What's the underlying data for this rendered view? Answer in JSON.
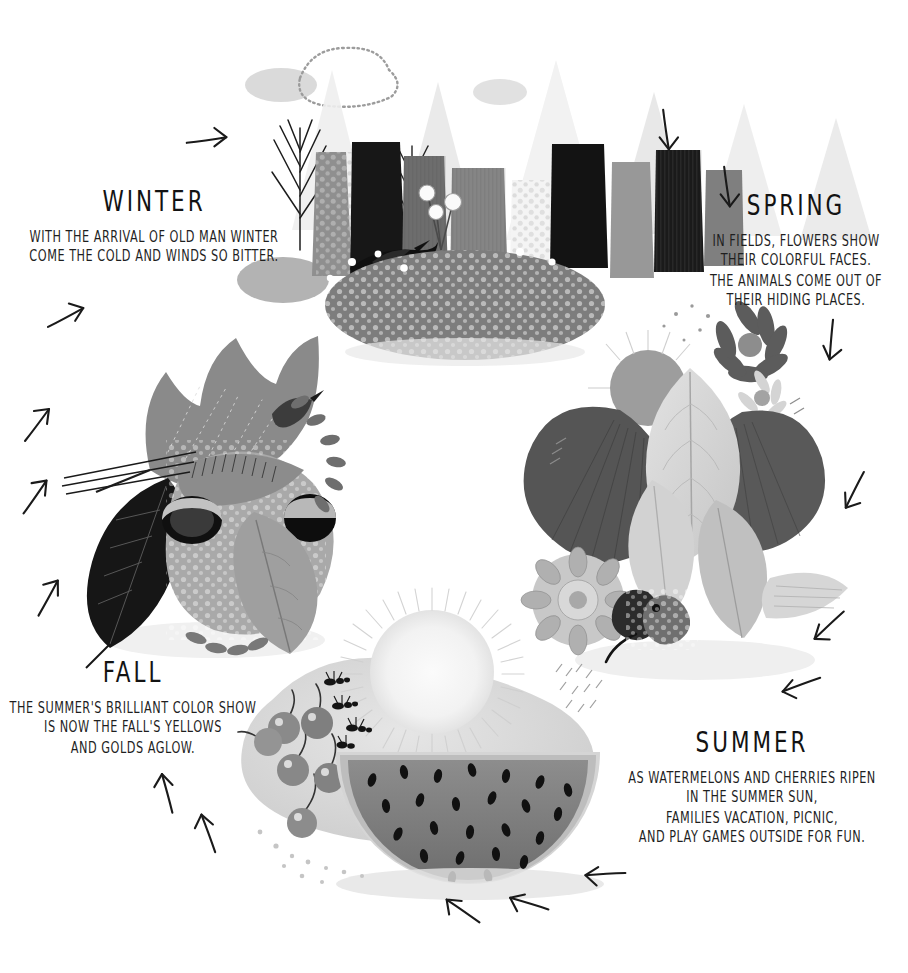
{
  "poster": {
    "theme": "four-seasons-cycle",
    "background_color": "#ffffff",
    "ink_color": "#1b1b1b",
    "cycle_direction": "clockwise"
  },
  "seasons": {
    "winter": {
      "title": "WINTER",
      "lines": [
        "WITH THE ARRIVAL OF OLD MAN WINTER",
        "COME THE COLD AND WINDS SO BITTER."
      ]
    },
    "spring": {
      "title": "SPRING",
      "lines": [
        "IN FIELDS, FLOWERS SHOW",
        "THEIR COLORFUL FACES.",
        "THE ANIMALS COME OUT OF",
        "THEIR HIDING PLACES."
      ]
    },
    "summer": {
      "title": "SUMMER",
      "lines": [
        "AS WATERMELONS AND CHERRIES RIPEN",
        "IN THE SUMMER SUN,",
        "FAMILIES VACATION, PICNIC,",
        "AND PLAY GAMES OUTSIDE FOR FUN."
      ]
    },
    "fall": {
      "title": "FALL",
      "lines": [
        "THE SUMMER'S BRILLIANT COLOR SHOW",
        "IS NOW THE FALL'S YELLOWS",
        "AND GOLDS AGLOW."
      ]
    }
  },
  "illustrations": [
    {
      "id": "winter-forest",
      "season": "winter",
      "description": "Snow-capped conifer forest with a black bird, white flowers, clouds and a speckled snowy ground",
      "elements": [
        "conifer-trees",
        "snow-caps",
        "black-bird",
        "white-flowers",
        "cloud",
        "dotted-cloud",
        "pebbled-ground"
      ]
    },
    {
      "id": "spring-bouquet",
      "season": "spring",
      "description": "Bouquet of broad leaves, daisies, chrysanthemums, dandelion puff and a butterfly",
      "elements": [
        "ginkgo-leaf",
        "pale-leaf",
        "daisy",
        "chrysanthemum",
        "dandelion-puff",
        "butterfly"
      ]
    },
    {
      "id": "summer-watermelon",
      "season": "summer",
      "description": "Watermelon slice with seeds, cherries, ants and a radiating sun",
      "elements": [
        "sun",
        "watermelon-slice",
        "watermelon-seeds",
        "cherries",
        "ants",
        "picnic-blanket"
      ]
    },
    {
      "id": "fall-leaves",
      "season": "fall",
      "description": "Maple and beech leaves with acorns, berry sprigs and a bird",
      "elements": [
        "maple-leaf",
        "dark-beech-leaf",
        "acorns",
        "berry-sprigs",
        "bird"
      ]
    }
  ],
  "flow_arrows": [
    {
      "id": "arrow-1",
      "x": 208,
      "y": 140,
      "angle": -45,
      "segment": "fall-to-winter"
    },
    {
      "id": "arrow-2",
      "x": 727,
      "y": 188,
      "angle": 45,
      "segment": "winter-to-spring"
    },
    {
      "id": "arrow-3",
      "x": 666,
      "y": 131,
      "angle": 45,
      "segment": "winter-to-spring"
    },
    {
      "id": "arrow-4",
      "x": 831,
      "y": 341,
      "angle": 58,
      "segment": "spring"
    },
    {
      "id": "arrow-5",
      "x": 854,
      "y": 491,
      "angle": 80,
      "segment": "spring"
    },
    {
      "id": "arrow-6",
      "x": 828,
      "y": 626,
      "angle": 100,
      "segment": "spring-to-summer"
    },
    {
      "id": "arrow-7",
      "x": 800,
      "y": 685,
      "angle": 123,
      "segment": "spring-to-summer"
    },
    {
      "id": "arrow-8",
      "x": 604,
      "y": 874,
      "angle": 140,
      "segment": "summer"
    },
    {
      "id": "arrow-9",
      "x": 528,
      "y": 903,
      "angle": 160,
      "segment": "summer"
    },
    {
      "id": "arrow-10",
      "x": 462,
      "y": 910,
      "angle": 178,
      "segment": "summer"
    },
    {
      "id": "arrow-11",
      "x": 208,
      "y": 832,
      "angle": 213,
      "segment": "summer-to-fall"
    },
    {
      "id": "arrow-12",
      "x": 167,
      "y": 792,
      "angle": 218,
      "segment": "summer-to-fall"
    },
    {
      "id": "arrow-13",
      "x": 49,
      "y": 597,
      "angle": 262,
      "segment": "fall"
    },
    {
      "id": "arrow-14",
      "x": 36,
      "y": 496,
      "angle": 268,
      "segment": "fall"
    },
    {
      "id": "arrow-15",
      "x": 38,
      "y": 424,
      "angle": 270,
      "segment": "fall"
    },
    {
      "id": "arrow-16",
      "x": 67,
      "y": 317,
      "angle": 295,
      "segment": "fall-to-winter"
    }
  ],
  "palette": {
    "near_black": "#141414",
    "dark_gray": "#3b3b3b",
    "mid_gray": "#7d7d7d",
    "light_gray": "#b4b4b4",
    "pale_gray": "#d8d8d8",
    "faint_gray": "#ededed"
  }
}
